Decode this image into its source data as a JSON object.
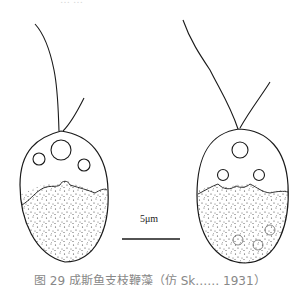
{
  "figure": {
    "top_text": "……",
    "caption": "图 29  成斯鱼支枝鞭藻（仿 Sk…… 1931）",
    "scale_bar": {
      "label": "5μm",
      "length_px": 55
    },
    "cells": [
      {
        "name": "left-cell",
        "flagella": 2,
        "vacuoles": 3,
        "granular_region": "lower half"
      },
      {
        "name": "right-cell",
        "flagella": 2,
        "vacuoles": 3,
        "granular_region": "lower half"
      }
    ],
    "colors": {
      "ink": "#1a1a1a",
      "background": "#ffffff"
    }
  }
}
